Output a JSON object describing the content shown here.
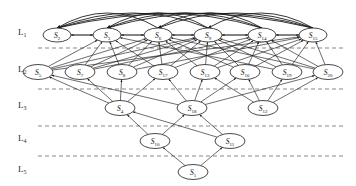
{
  "figure": {
    "type": "layered-directed-graph",
    "background_color": "#ffffff",
    "node_stroke_color": "#1a1a1a",
    "edge_color": "#1d1d1d",
    "separator_color": "#555555",
    "width": 356,
    "height": 186
  },
  "levels": [
    {
      "id": "L1",
      "label": "L",
      "subscript": "1",
      "label_x": 18,
      "label_y": 35,
      "separator_y": 48
    },
    {
      "id": "L2",
      "label": "L",
      "subscript": "2",
      "label_x": 18,
      "label_y": 72,
      "separator_y": 89
    },
    {
      "id": "L3",
      "label": "L",
      "subscript": "3",
      "label_x": 18,
      "label_y": 108,
      "separator_y": 126
    },
    {
      "id": "L4",
      "label": "L",
      "subscript": "4",
      "label_x": 18,
      "label_y": 141,
      "separator_y": 156
    },
    {
      "id": "L5",
      "label": "L",
      "subscript": "5",
      "label_x": 18,
      "label_y": 172,
      "separator_y": null
    }
  ],
  "separator_x_start": 38,
  "separator_x_end": 344,
  "nodes": [
    {
      "id": "n2",
      "name": "S",
      "subscript": "2",
      "level": "L1",
      "cx": 57,
      "cy": 35,
      "rx": 14,
      "ry": 7
    },
    {
      "id": "n3",
      "name": "S",
      "subscript": "3",
      "level": "L1",
      "cx": 107,
      "cy": 35,
      "rx": 14,
      "ry": 7
    },
    {
      "id": "n6",
      "name": "S",
      "subscript": "6",
      "level": "L1",
      "cx": 158,
      "cy": 35,
      "rx": 14,
      "ry": 7
    },
    {
      "id": "n9",
      "name": "S",
      "subscript": "9",
      "level": "L1",
      "cx": 208,
      "cy": 35,
      "rx": 14,
      "ry": 7
    },
    {
      "id": "n14",
      "name": "S",
      "subscript": "14",
      "level": "L1",
      "cx": 262,
      "cy": 35,
      "rx": 14,
      "ry": 7
    },
    {
      "id": "n15",
      "name": "S",
      "subscript": "15",
      "level": "L1",
      "cx": 313,
      "cy": 35,
      "rx": 14,
      "ry": 7
    },
    {
      "id": "n5",
      "name": "S",
      "subscript": "5",
      "level": "L2",
      "cx": 38,
      "cy": 72,
      "rx": 15,
      "ry": 7.5
    },
    {
      "id": "n7",
      "name": "S",
      "subscript": "7",
      "level": "L2",
      "cx": 80,
      "cy": 72,
      "rx": 15,
      "ry": 7.5
    },
    {
      "id": "n8",
      "name": "S",
      "subscript": "8",
      "level": "L2",
      "cx": 122,
      "cy": 72,
      "rx": 15,
      "ry": 7.5
    },
    {
      "id": "n17",
      "name": "S",
      "subscript": "17",
      "level": "L2",
      "cx": 163,
      "cy": 72,
      "rx": 15,
      "ry": 7.5
    },
    {
      "id": "n13",
      "name": "S",
      "subscript": "13",
      "level": "L2",
      "cx": 205,
      "cy": 72,
      "rx": 15,
      "ry": 7.5
    },
    {
      "id": "n16",
      "name": "S",
      "subscript": "16",
      "level": "L2",
      "cx": 245,
      "cy": 72,
      "rx": 15,
      "ry": 7.5
    },
    {
      "id": "n19",
      "name": "S",
      "subscript": "19",
      "level": "L2",
      "cx": 287,
      "cy": 72,
      "rx": 15,
      "ry": 7.5
    },
    {
      "id": "n20",
      "name": "S",
      "subscript": "20",
      "level": "L2",
      "cx": 328,
      "cy": 72,
      "rx": 15,
      "ry": 7.5
    },
    {
      "id": "n4",
      "name": "S",
      "subscript": "4",
      "level": "L3",
      "cx": 120,
      "cy": 108,
      "rx": 15,
      "ry": 7.5
    },
    {
      "id": "n18",
      "name": "S",
      "subscript": "18",
      "level": "L3",
      "cx": 192,
      "cy": 108,
      "rx": 15,
      "ry": 7.5
    },
    {
      "id": "n12",
      "name": "S",
      "subscript": "12",
      "level": "L3",
      "cx": 263,
      "cy": 108,
      "rx": 15,
      "ry": 7.5
    },
    {
      "id": "n10",
      "name": "S",
      "subscript": "10",
      "level": "L4",
      "cx": 155,
      "cy": 141,
      "rx": 15,
      "ry": 7.5
    },
    {
      "id": "n11",
      "name": "S",
      "subscript": "11",
      "level": "L4",
      "cx": 230,
      "cy": 141,
      "rx": 15,
      "ry": 7.5
    },
    {
      "id": "n1",
      "name": "S",
      "subscript": "1",
      "level": "L5",
      "cx": 193,
      "cy": 172,
      "rx": 15,
      "ry": 7.5
    }
  ],
  "edges": {
    "l1_horizontal_pairs": [
      [
        "n3",
        "n2"
      ],
      [
        "n6",
        "n3"
      ],
      [
        "n9",
        "n6"
      ],
      [
        "n14",
        "n9"
      ],
      [
        "n15",
        "n14"
      ],
      [
        "n2",
        "n3"
      ],
      [
        "n3",
        "n6"
      ],
      [
        "n6",
        "n9"
      ],
      [
        "n9",
        "n14"
      ],
      [
        "n14",
        "n15"
      ]
    ],
    "l1_arcs": [
      [
        "n15",
        "n2"
      ],
      [
        "n14",
        "n2"
      ],
      [
        "n9",
        "n3"
      ],
      [
        "n15",
        "n6"
      ],
      [
        "n14",
        "n3"
      ],
      [
        "n9",
        "n2"
      ],
      [
        "n15",
        "n9"
      ],
      [
        "n14",
        "n6"
      ],
      [
        "n6",
        "n2"
      ],
      [
        "n15",
        "n3"
      ]
    ],
    "l2_to_l1": [
      [
        "n5",
        "n3"
      ],
      [
        "n5",
        "n6"
      ],
      [
        "n5",
        "n9"
      ],
      [
        "n5",
        "n15"
      ],
      [
        "n7",
        "n3"
      ],
      [
        "n7",
        "n6"
      ],
      [
        "n7",
        "n9"
      ],
      [
        "n7",
        "n14"
      ],
      [
        "n8",
        "n3"
      ],
      [
        "n8",
        "n6"
      ],
      [
        "n8",
        "n9"
      ],
      [
        "n8",
        "n15"
      ],
      [
        "n17",
        "n6"
      ],
      [
        "n17",
        "n9"
      ],
      [
        "n17",
        "n14"
      ],
      [
        "n17",
        "n3"
      ],
      [
        "n13",
        "n6"
      ],
      [
        "n13",
        "n9"
      ],
      [
        "n13",
        "n14"
      ],
      [
        "n13",
        "n15"
      ],
      [
        "n16",
        "n9"
      ],
      [
        "n16",
        "n14"
      ],
      [
        "n16",
        "n15"
      ],
      [
        "n16",
        "n6"
      ],
      [
        "n19",
        "n9"
      ],
      [
        "n19",
        "n14"
      ],
      [
        "n19",
        "n15"
      ],
      [
        "n19",
        "n3"
      ],
      [
        "n20",
        "n14"
      ],
      [
        "n20",
        "n15"
      ],
      [
        "n20",
        "n9"
      ],
      [
        "n20",
        "n6"
      ]
    ],
    "l3_to_l2": [
      [
        "n4",
        "n5"
      ],
      [
        "n4",
        "n7"
      ],
      [
        "n4",
        "n8"
      ],
      [
        "n4",
        "n17"
      ],
      [
        "n18",
        "n17"
      ],
      [
        "n18",
        "n13"
      ],
      [
        "n18",
        "n16"
      ],
      [
        "n18",
        "n5"
      ],
      [
        "n18",
        "n20"
      ],
      [
        "n12",
        "n13"
      ],
      [
        "n12",
        "n16"
      ],
      [
        "n12",
        "n19"
      ],
      [
        "n12",
        "n20"
      ]
    ],
    "l4_to_l3": [
      [
        "n10",
        "n4"
      ],
      [
        "n10",
        "n18"
      ],
      [
        "n11",
        "n4"
      ],
      [
        "n11",
        "n18"
      ]
    ],
    "l5_to_l4": [
      [
        "n1",
        "n10"
      ],
      [
        "n1",
        "n11"
      ]
    ]
  }
}
